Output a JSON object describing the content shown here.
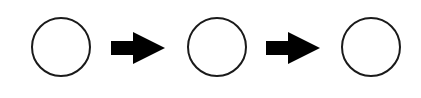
{
  "diagram": {
    "type": "flow",
    "nodes": [
      {
        "id": "circle-1",
        "shape": "circle",
        "label": ""
      },
      {
        "id": "circle-2",
        "shape": "circle",
        "label": ""
      },
      {
        "id": "circle-3",
        "shape": "circle",
        "label": ""
      }
    ],
    "edges": [
      {
        "from": "circle-1",
        "to": "circle-2",
        "icon": "right-arrow-icon"
      },
      {
        "from": "circle-2",
        "to": "circle-3",
        "icon": "right-arrow-icon"
      }
    ],
    "colors": {
      "stroke": "#1a1a1a",
      "arrow": "#000000",
      "background": "#ffffff"
    }
  }
}
